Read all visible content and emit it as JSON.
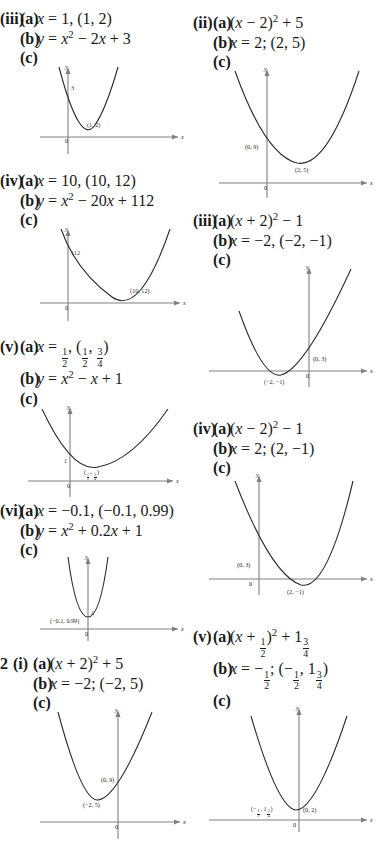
{
  "page": {
    "background": "#ffffff",
    "text_color": "#1a1a1a",
    "axis_color": "#808080",
    "curve_color": "#2a2a2a"
  },
  "left_column": {
    "items": [
      {
        "roman": "(iii)",
        "part_a_label": "(a)",
        "part_a_text": "x = 1, (1, 2)",
        "part_b_label": "(b)",
        "part_b_text": "y = x² − 2x + 3",
        "part_c_label": "(c)",
        "graph": {
          "y_axis_label": "y",
          "x_axis_label": "x",
          "origin_label": "0",
          "intercept_label": "3",
          "vertex_label": "(1, 2)"
        }
      },
      {
        "roman": "(iv)",
        "part_a_label": "(a)",
        "part_a_text": "x = 10, (10, 12)",
        "part_b_label": "(b)",
        "part_b_text": "y = x² − 20x + 112",
        "part_c_label": "(c)",
        "graph": {
          "y_axis_label": "y",
          "x_axis_label": "x",
          "origin_label": "0",
          "intercept_label": "112",
          "vertex_label": "(10, 12)"
        }
      },
      {
        "roman": "(v)",
        "part_a_label": "(a)",
        "part_a_text": "x = 1/2, (1/2, 3/4)",
        "part_b_label": "(b)",
        "part_b_text": "y = x² − x + 1",
        "part_c_label": "(c)",
        "graph": {
          "y_axis_label": "y",
          "x_axis_label": "x",
          "origin_label": "0",
          "intercept_label": "1",
          "vertex_label": "(1/2, 3/4)"
        }
      },
      {
        "roman": "(vi)",
        "part_a_label": "(a)",
        "part_a_text": "x = −0.1, (−0.1, 0.99)",
        "part_b_label": "(b)",
        "part_b_text": "y = x² + 0.2x + 1",
        "part_c_label": "(c)",
        "graph": {
          "y_axis_label": "y",
          "x_axis_label": "x",
          "origin_label": "0",
          "intercept_label": "1",
          "vertex_label": "(−0.1, 0.99)"
        }
      },
      {
        "question_number": "2",
        "roman": "(i)",
        "part_a_label": "(a)",
        "part_a_text": "(x + 2)² + 5",
        "part_b_label": "(b)",
        "part_b_text": "x = −2; (−2, 5)",
        "part_c_label": "(c)",
        "graph": {
          "y_axis_label": "y",
          "x_axis_label": "x",
          "origin_label": "0",
          "intercept_label": "(0, 9)",
          "vertex_label": "(−2, 5)"
        }
      }
    ]
  },
  "right_column": {
    "items": [
      {
        "roman": "(ii)",
        "part_a_label": "(a)",
        "part_a_text": "(x − 2)² + 5",
        "part_b_label": "(b)",
        "part_b_text": "x = 2; (2, 5)",
        "part_c_label": "(c)",
        "graph": {
          "y_axis_label": "y",
          "x_axis_label": "x",
          "origin_label": "0",
          "intercept_label": "(0, 9)",
          "vertex_label": "(2, 5)"
        }
      },
      {
        "roman": "(iii)",
        "part_a_label": "(a)",
        "part_a_text": "(x + 2)² − 1",
        "part_b_label": "(b)",
        "part_b_text": "x = −2, (−2, −1)",
        "part_c_label": "(c)",
        "graph": {
          "y_axis_label": "y",
          "x_axis_label": "x",
          "origin_label": "0",
          "intercept_label": "(0, 3)",
          "vertex_label": "(−2, −1)"
        }
      },
      {
        "roman": "(iv)",
        "part_a_label": "(a)",
        "part_a_text": "(x − 2)² − 1",
        "part_b_label": "(b)",
        "part_b_text": "x = 2; (2, −1)",
        "part_c_label": "(c)",
        "graph": {
          "y_axis_label": "y",
          "x_axis_label": "x",
          "origin_label": "0",
          "intercept_label": "(0, 3)",
          "vertex_label": "(2, −1)"
        }
      },
      {
        "roman": "(v)",
        "part_a_label": "(a)",
        "part_a_text": "(x + 1/2)² + 1 3/4",
        "part_b_label": "(b)",
        "part_b_text": "x = −1/2; (−1/2, 1 3/4)",
        "part_c_label": "(c)",
        "graph": {
          "y_axis_label": "y",
          "x_axis_label": "x",
          "origin_label": "0",
          "intercept_label": "(0, 2)",
          "vertex_label": "(−1/2, 1 3/4)"
        }
      }
    ]
  }
}
